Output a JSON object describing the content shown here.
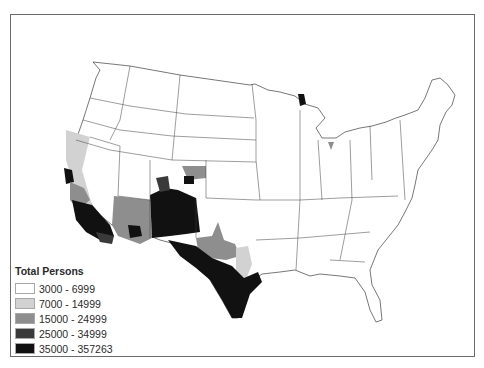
{
  "legend": {
    "title": "Total Persons",
    "classes": [
      {
        "label": "3000 - 6999",
        "color": "#ffffff"
      },
      {
        "label": "7000 - 14999",
        "color": "#d2d2d2"
      },
      {
        "label": "15000 - 24999",
        "color": "#8e8e8e"
      },
      {
        "label": "25000 - 34999",
        "color": "#3a3a3a"
      },
      {
        "label": "35000 - 357263",
        "color": "#111111"
      }
    ]
  },
  "map": {
    "subject": "Contiguous United States choropleth by county",
    "outline_color": "#3c3c3c"
  }
}
